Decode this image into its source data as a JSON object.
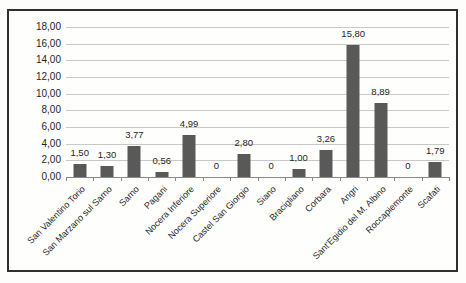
{
  "chart_data": {
    "type": "bar",
    "title": "",
    "xlabel": "",
    "ylabel": "",
    "categories": [
      "San Valentino Torio",
      "San Marzano sul Sarno",
      "Sarno",
      "Pagani",
      "Nocera Inferiore",
      "Nocera Superiore",
      "Castel San Giorgio",
      "Siano",
      "Bracigliano",
      "Corbara",
      "Angri",
      "Sant'Egidio del M. Albino",
      "Roccapiemonte",
      "Scafati"
    ],
    "values": [
      1.5,
      1.3,
      3.77,
      0.56,
      4.99,
      0,
      2.8,
      0,
      1.0,
      3.26,
      15.8,
      8.89,
      0,
      1.79
    ],
    "value_labels": [
      "1,50",
      "1,30",
      "3,77",
      "0,56",
      "4,99",
      "0",
      "2,80",
      "0",
      "1,00",
      "3,26",
      "15,80",
      "8,89",
      "0",
      "1,79"
    ],
    "y_tick_labels": [
      "18,00",
      "16,00",
      "14,00",
      "12,00",
      "10,00",
      "8,00",
      "6,00",
      "4,00",
      "2,00",
      "0,00"
    ],
    "ylim": [
      0,
      18
    ],
    "y_step": 2,
    "grid": true,
    "legend": false,
    "bar_color": "#595959",
    "gridline_color": "#c9c9c6",
    "frame_color": "#2f2f2f"
  }
}
